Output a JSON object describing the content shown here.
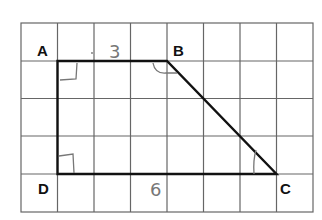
{
  "diagram": {
    "type": "trapezoid-on-grid",
    "grid": {
      "columns": 8,
      "rows": 5
    },
    "vertices": [
      {
        "label": "A",
        "grid_x": 1,
        "grid_y": 1
      },
      {
        "label": "B",
        "grid_x": 4,
        "grid_y": 1
      },
      {
        "label": "C",
        "grid_x": 7,
        "grid_y": 4
      },
      {
        "label": "D",
        "grid_x": 1,
        "grid_y": 4
      }
    ],
    "handwritten_labels": {
      "top_side": "3",
      "bottom_side": "6"
    },
    "right_angle_marks": [
      "A",
      "B",
      "D"
    ],
    "angle_mark": "C",
    "colors": {
      "grid": "#555555",
      "shape": "#111111",
      "handwriting": "#777777"
    }
  }
}
